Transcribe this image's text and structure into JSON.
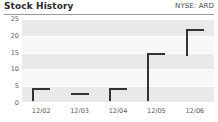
{
  "header": {
    "title": "Stock History",
    "ticker": "NYSE: ARD"
  },
  "chart_data": {
    "type": "bar",
    "title": "Stock History",
    "subtitle": "NYSE: ARD",
    "xlabel": "",
    "ylabel": "",
    "ylim": [
      0,
      25
    ],
    "yticks": [
      0,
      5,
      10,
      15,
      20,
      25
    ],
    "ytick_labels": [
      "0",
      "5",
      "10",
      "15",
      "20",
      "25"
    ],
    "grid": true,
    "legend": "none",
    "categories": [
      "12/02",
      "12/03",
      "12/04",
      "12/05",
      "12/06"
    ],
    "series": [
      {
        "name": "Low",
        "values": [
          0.5,
          2.5,
          0.5,
          0.5,
          14.0
        ]
      },
      {
        "name": "High",
        "values": [
          4.5,
          3.0,
          4.5,
          15.0,
          22.0
        ]
      },
      {
        "name": "Close",
        "values": [
          4.5,
          3.0,
          4.5,
          15.0,
          22.0
        ]
      }
    ],
    "points": [
      {
        "x": "12/02",
        "low": 0.5,
        "high": 4.5,
        "close": 4.5
      },
      {
        "x": "12/03",
        "low": 2.5,
        "high": 3.0,
        "close": 3.0
      },
      {
        "x": "12/04",
        "low": 0.5,
        "high": 4.5,
        "close": 4.5
      },
      {
        "x": "12/05",
        "low": 0.5,
        "high": 15.0,
        "close": 15.0
      },
      {
        "x": "12/06",
        "low": 14.0,
        "high": 22.0,
        "close": 22.0
      }
    ],
    "colors": {
      "mark": "#333333",
      "band_shade": "#e9e9e9",
      "band_plain": "#f7f7f7",
      "text": "#5a5a5a",
      "title": "#2b2b2b",
      "rule": "#9a9a9a"
    }
  }
}
